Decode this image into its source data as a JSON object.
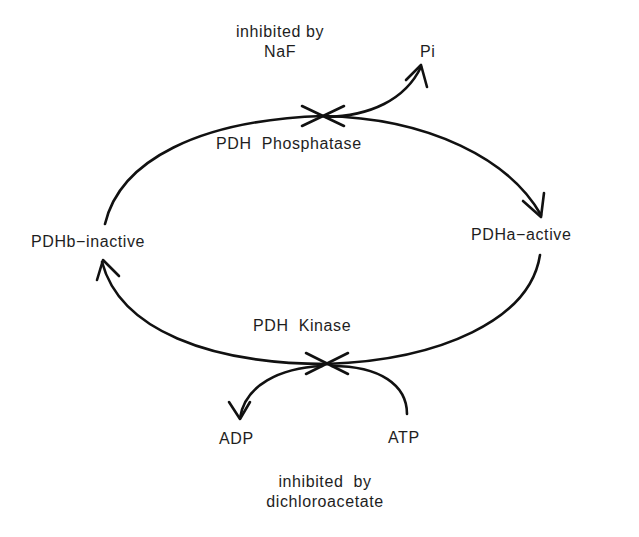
{
  "diagram": {
    "nodes": {
      "inactive": "PDHb−inactive",
      "active": "PDHa−active"
    },
    "enzymes": {
      "phosphatase": "PDH  Phosphatase",
      "kinase": "PDH  Kinase"
    },
    "inhibitors": {
      "phosphatase_line1": "inhibited  by",
      "phosphatase_line2": "NaF",
      "kinase_line1": "inhibited  by",
      "kinase_line2": "dichloroacetate"
    },
    "products": {
      "pi": "Pi",
      "adp": "ADP",
      "atp": "ATP"
    },
    "edges": [
      {
        "from": "PDHb-inactive",
        "to": "PDHa-active",
        "via": "PDH Phosphatase",
        "releases": "Pi"
      },
      {
        "from": "PDHa-active",
        "to": "PDHb-inactive",
        "via": "PDH Kinase",
        "consumes": "ATP",
        "releases": "ADP"
      }
    ]
  }
}
